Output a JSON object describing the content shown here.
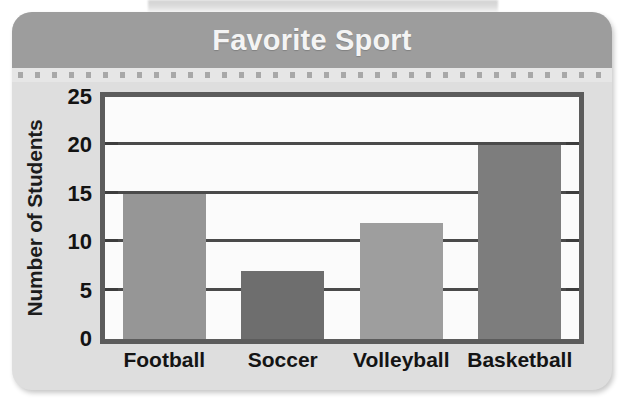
{
  "card": {
    "title": "Favorite Sport",
    "title_band_color": "#9d9d9d",
    "background_color": "#dedede",
    "title_color": "#f4f4f4"
  },
  "chart_data": {
    "type": "bar",
    "title": "Favorite Sport",
    "xlabel": "",
    "ylabel": "Number of Students",
    "categories": [
      "Football",
      "Soccer",
      "Volleyball",
      "Basketball"
    ],
    "values": [
      15,
      7,
      12,
      20
    ],
    "bar_colors": [
      "#969696",
      "#6e6e6e",
      "#9e9e9e",
      "#7d7d7d"
    ],
    "ylim": [
      0,
      25
    ],
    "ytick_labels": [
      "0",
      "5",
      "10",
      "15",
      "20",
      "25"
    ],
    "ytick_values": [
      0,
      5,
      10,
      15,
      20,
      25
    ],
    "gridline_values": [
      5,
      10,
      15,
      20
    ],
    "grid": true,
    "legend": "none",
    "plot_background": "#fbfbfb",
    "frame_color": "#5c5c5c",
    "gridline_color": "#4a4a4a"
  }
}
